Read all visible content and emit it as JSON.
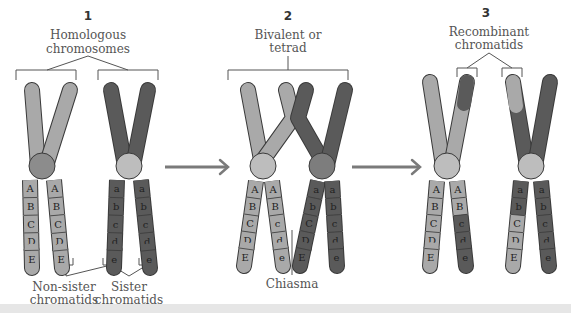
{
  "diagram": {
    "colors": {
      "light": "#a9a9a9",
      "mid": "#8c8c8c",
      "dark": "#5a5a5a",
      "centromere_light": "#bdbdbd",
      "centromere_mid": "#7d7d7d",
      "outline": "#3a3a3a",
      "line": "#555555",
      "arrow": "#7a7a7a"
    },
    "stages": [
      {
        "number": "1",
        "label_lines": [
          "Homologous",
          "chromosomes"
        ],
        "chromatids": [
          {
            "shade": "light",
            "bands": [
              "A",
              "B",
              "C",
              "D",
              "E"
            ]
          },
          {
            "shade": "light",
            "bands": [
              "A",
              "B",
              "C",
              "D",
              "E"
            ]
          },
          {
            "shade": "dark",
            "bands": [
              "a",
              "b",
              "c",
              "d",
              "e"
            ]
          },
          {
            "shade": "dark",
            "bands": [
              "a",
              "b",
              "c",
              "d",
              "e"
            ]
          }
        ],
        "bottom_labels": [
          {
            "lines": [
              "Non-sister",
              "chromatids"
            ]
          },
          {
            "lines": [
              "Sister",
              "chromatids"
            ]
          }
        ]
      },
      {
        "number": "2",
        "label_lines": [
          "Bivalent or",
          "tetrad"
        ],
        "chromatids": [
          {
            "shade": "light",
            "bands": [
              "A",
              "B",
              "C",
              "D",
              "E"
            ]
          },
          {
            "shade": "light",
            "bands": [
              "A",
              "B",
              "c",
              "d",
              "e"
            ]
          },
          {
            "shade": "dark",
            "bands": [
              "a",
              "b",
              "C",
              "D",
              "E"
            ]
          },
          {
            "shade": "dark",
            "bands": [
              "a",
              "b",
              "c",
              "d",
              "e"
            ]
          }
        ],
        "bottom_labels": [
          {
            "lines": [
              "Chiasma"
            ]
          }
        ]
      },
      {
        "number": "3",
        "label_lines": [
          "Recombinant",
          "chromatids"
        ],
        "chromatids": [
          {
            "shade": "light",
            "bands": [
              "A",
              "B",
              "C",
              "D",
              "E"
            ]
          },
          {
            "shade": "light",
            "bands": [
              "A",
              "B",
              "c",
              "d",
              "e"
            ]
          },
          {
            "shade": "dark",
            "bands": [
              "a",
              "b",
              "C",
              "D",
              "E"
            ]
          },
          {
            "shade": "dark",
            "bands": [
              "a",
              "b",
              "c",
              "d",
              "e"
            ]
          }
        ],
        "bottom_labels": []
      }
    ]
  }
}
